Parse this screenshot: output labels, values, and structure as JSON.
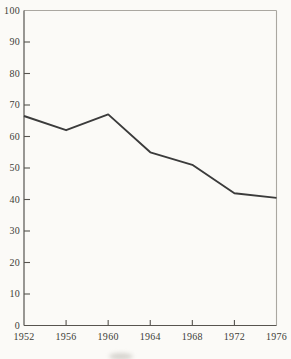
{
  "chart_data": {
    "type": "line",
    "title": "",
    "xlabel": "",
    "ylabel": "",
    "x": [
      1952,
      1956,
      1960,
      1964,
      1968,
      1972,
      1976
    ],
    "values": [
      66.5,
      62,
      67,
      55,
      51,
      42,
      40.5
    ],
    "series": [
      {
        "name": "single-unnamed-series",
        "values": [
          66.5,
          62,
          67,
          55,
          51,
          42,
          40.5
        ]
      }
    ],
    "xlim": [
      1952,
      1976
    ],
    "ylim": [
      0,
      100
    ],
    "x_tick_labels": [
      "1952",
      "1956",
      "1960",
      "1964",
      "1968",
      "1972",
      "1976"
    ],
    "y_tick_values": [
      0,
      10,
      20,
      30,
      40,
      50,
      60,
      70,
      80,
      90,
      100
    ],
    "y_tick_labels": [
      "0",
      "10",
      "20",
      "30",
      "40",
      "50",
      "60",
      "70",
      "80",
      "90",
      "100"
    ],
    "grid": false,
    "legend": false,
    "colors": {
      "line": "#3b3b3b",
      "axis": "#57544f",
      "border": "#aaa7a1",
      "label": "#403d38",
      "paper": "#fbfaf7"
    }
  }
}
